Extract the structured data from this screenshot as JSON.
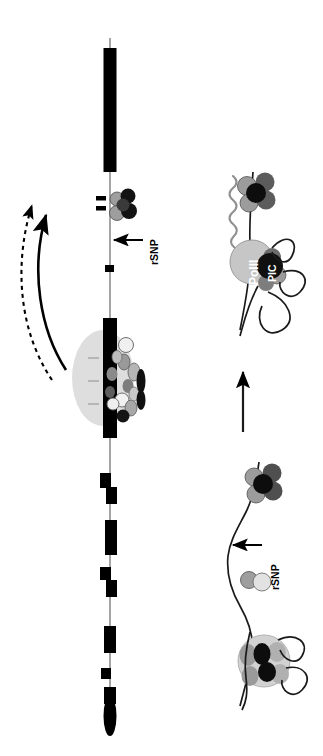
{
  "figure": {
    "orientation_deg": 90,
    "background_color": "#ffffff",
    "ink_color": "#000000"
  },
  "labels": {
    "gene_name": "Luc7L",
    "rsnp_top": "rSNP",
    "rsnp_bottom": "rSNP",
    "polymerase": "PolII",
    "preinitiation_complex": "PIC"
  },
  "colors": {
    "exon_black": "#000000",
    "intron_line": "#808080",
    "spliceosome_halo": "#d9d9d9",
    "nucleosome_light": "#bfbfbf",
    "nucleosome_mid": "#8c8c8c",
    "nucleosome_dark": "#4d4d4d",
    "nucleosome_black": "#0d0d0d",
    "polii_fill": "#c4c4c4",
    "pic_fill": "#101010",
    "rna_squiggle": "#8f8f8f",
    "white_protein": "#f2f2f2"
  },
  "panels": {
    "gene_track": {
      "name": "Luc7L gene model",
      "description": "Horizontal (rotated vertical) gene diagram with black exon blocks on a thin gray intron line, terminating in a black lens-shaped 3-prime element.",
      "exon_count": 12,
      "exons": [
        {
          "index": 1,
          "start": 48,
          "length": 124,
          "thickness": 13,
          "note": "first large exon, Luc7L label"
        },
        {
          "index": 2,
          "start": 196,
          "length": 5,
          "thickness": 5,
          "note": "tick"
        },
        {
          "index": 3,
          "start": 205,
          "length": 5,
          "thickness": 5,
          "note": "tick"
        },
        {
          "index": 4,
          "start": 265,
          "length": 7,
          "thickness": 9
        },
        {
          "index": 5,
          "start": 318,
          "length": 120,
          "thickness": 14,
          "note": "spliceosome-bound exon"
        },
        {
          "index": 6,
          "start": 473,
          "length": 14,
          "thickness": 11
        },
        {
          "index": 7,
          "start": 487,
          "length": 16,
          "thickness": 11
        },
        {
          "index": 8,
          "start": 520,
          "length": 34,
          "thickness": 12
        },
        {
          "index": 9,
          "start": 567,
          "length": 12,
          "thickness": 11
        },
        {
          "index": 10,
          "start": 581,
          "length": 16,
          "thickness": 11
        },
        {
          "index": 11,
          "start": 626,
          "length": 26,
          "thickness": 12
        },
        {
          "index": 12,
          "start": 668,
          "length": 10,
          "thickness": 10
        },
        {
          "index": 13,
          "start": 687,
          "length": 16,
          "thickness": 12
        }
      ],
      "terminator": {
        "shape": "lens-oval",
        "center": 716,
        "length": 40,
        "width": 13
      }
    },
    "spliceosome": {
      "name": "spliceosome complex",
      "description": "Gray elliptical halo containing many small colored protein subunits assembled on the exon.",
      "center_x": 103,
      "center_y": 378,
      "radius_x": 31,
      "radius_y": 48,
      "subunit_count": 14
    },
    "snrnp_top": {
      "name": "U1 snRNP cluster at rSNP",
      "description": "Four-lobed dark protein cluster bound adjacent to the two small exon ticks.",
      "center_x": 122,
      "center_y": 205
    },
    "arrows": {
      "curved_solid": {
        "label": "increased transcription",
        "style": "solid",
        "head": "filled"
      },
      "curved_dashed": {
        "label": "increased splicing",
        "style": "dashed",
        "head": "filled"
      },
      "vertical": {
        "label": "leads to",
        "style": "solid",
        "head": "filled"
      },
      "rsnp_top_pointer": {
        "style": "solid",
        "head": "filled"
      },
      "rsnp_bottom_pointer": {
        "style": "solid",
        "head": "filled"
      }
    },
    "chromatin_lower": {
      "name": "closed chromatin state",
      "description": "Nucleosome with wrapped DNA loops, a small two-bead factor, and a free nucleosome near the rSNP on the DNA fiber."
    },
    "chromatin_upper": {
      "name": "open chromatin with PIC and PolII",
      "description": "Assembled pre-initiation complex (PIC) with RNA polymerase II (PolII) on looped DNA, nucleosome above, and nascent RNA squiggle."
    }
  }
}
